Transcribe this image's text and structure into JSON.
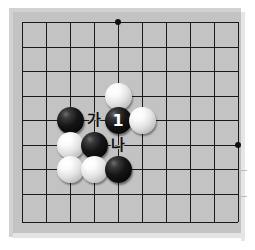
{
  "figure": {
    "type": "go-board-diagram",
    "title": "",
    "background_color": "#ffffff"
  },
  "board": {
    "name": "go-board",
    "surface_color": "#c3c3c3",
    "mat_color": "#d2d2d2",
    "line_color": "#1a1a1a",
    "origin_x": 22,
    "origin_y": 22,
    "cell_size": 24,
    "columns": 10,
    "rows": 9,
    "column_lines_x": [
      22,
      46,
      70,
      94,
      118,
      142,
      166,
      190,
      214,
      238
    ],
    "row_lines_y": [
      22,
      47,
      71,
      96,
      120,
      145,
      169,
      194,
      222
    ],
    "star_points": [
      {
        "name": "star-point-top",
        "col": 4,
        "row": 0
      },
      {
        "name": "star-point-right",
        "col": 9,
        "row": 5
      }
    ],
    "edge_ticks": [
      {
        "name": "edge-tick-upper",
        "x": 241,
        "y": 170
      },
      {
        "name": "edge-tick-lower",
        "x": 241,
        "y": 196
      }
    ]
  },
  "stones": [
    {
      "id": "white-d4",
      "color": "white",
      "col": 4,
      "row": 3,
      "label": ""
    },
    {
      "id": "black-b5",
      "color": "black",
      "col": 2,
      "row": 4,
      "label": ""
    },
    {
      "id": "black-1",
      "color": "black",
      "col": 4,
      "row": 4,
      "label": "1"
    },
    {
      "id": "white-f5",
      "color": "white",
      "col": 5,
      "row": 4,
      "label": ""
    },
    {
      "id": "white-b6",
      "color": "white",
      "col": 2,
      "row": 5,
      "label": ""
    },
    {
      "id": "black-c6",
      "color": "black",
      "col": 3,
      "row": 5,
      "label": ""
    },
    {
      "id": "white-b7",
      "color": "white",
      "col": 2,
      "row": 6,
      "label": ""
    },
    {
      "id": "white-c7",
      "color": "white",
      "col": 3,
      "row": 6,
      "label": ""
    },
    {
      "id": "black-d7",
      "color": "black",
      "col": 4,
      "row": 6,
      "label": ""
    }
  ],
  "move_numbers": [
    {
      "id": "move-1",
      "text": "1",
      "col": 4,
      "row": 4,
      "on_color": "black"
    }
  ],
  "point_labels": [
    {
      "id": "label-ga",
      "text": "가",
      "col": 3,
      "row": 4
    },
    {
      "id": "label-na",
      "text": "나",
      "col": 4,
      "row": 5
    }
  ],
  "colors": {
    "stone_black": "#000000",
    "stone_white": "#ffffff",
    "grid": "#1a1a1a",
    "board": "#c3c3c3",
    "label_text": "#111111",
    "number_text": "#ffffff"
  }
}
